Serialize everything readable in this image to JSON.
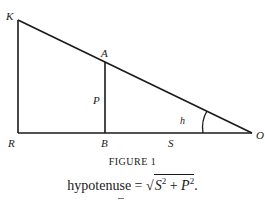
{
  "figure": {
    "points": {
      "K": {
        "label": "K",
        "x": 18,
        "y": 20
      },
      "A": {
        "label": "A",
        "x": 105,
        "y": 60
      },
      "R": {
        "label": "R",
        "x": 18,
        "y": 133
      },
      "B": {
        "label": "B",
        "x": 105,
        "y": 133
      },
      "O": {
        "label": "O",
        "x": 252,
        "y": 133
      }
    },
    "segment_labels": {
      "P": "P",
      "S": "S",
      "h": "h"
    },
    "caption": "FIGURE 1"
  },
  "formula": {
    "lhs": "hypotenuse",
    "equals": "=",
    "s_var": "S",
    "s_exp": "2",
    "plus": "+",
    "p_var": "P",
    "p_exp": "2",
    "end": "."
  },
  "colors": {
    "ink": "#1a1a1a",
    "background": "#ffffff"
  }
}
